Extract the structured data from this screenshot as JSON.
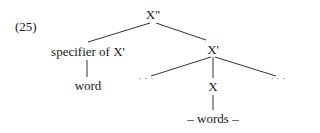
{
  "example_number": "(25)",
  "tree": {
    "root": "X\"",
    "specifier": "specifier of X'",
    "specifier_child": "word",
    "bar": "X'",
    "left_dots": "· · ·",
    "head": "X",
    "right_dots": "· · ·",
    "head_child": "– words –"
  }
}
